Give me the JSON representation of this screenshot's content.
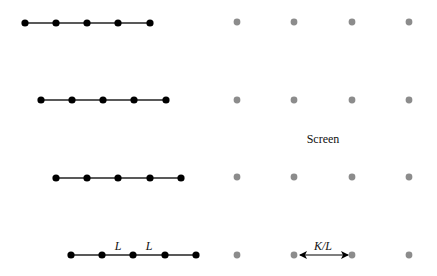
{
  "diagram": {
    "screen_label": "Screen",
    "spacing_label": "L",
    "screen_spacing_label": "K/L",
    "colors": {
      "chain_dot": "#000000",
      "chain_line": "#222222",
      "screen_dot": "#8c8c8c",
      "background": "#ffffff"
    },
    "chains": [
      {
        "y": 23,
        "x": [
          25,
          56,
          87,
          118,
          150
        ]
      },
      {
        "y": 100,
        "x": [
          41,
          72,
          103,
          134,
          166
        ]
      },
      {
        "y": 178,
        "x": [
          56,
          87,
          118,
          150,
          181
        ]
      },
      {
        "y": 255,
        "x": [
          71,
          102,
          133,
          165,
          196
        ]
      }
    ],
    "screen_grid": {
      "x": [
        237,
        294,
        352,
        409
      ],
      "y": [
        22,
        100,
        177,
        255
      ]
    }
  }
}
